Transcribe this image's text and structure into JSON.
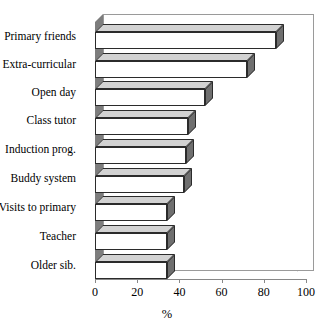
{
  "chart_data": {
    "type": "bar",
    "orientation": "horizontal",
    "title": "",
    "xlabel": "%",
    "ylabel": "",
    "xlim": [
      0,
      100
    ],
    "xticks": [
      0,
      20,
      40,
      60,
      80,
      100
    ],
    "grid": false,
    "style": "3d-horizontal-bar",
    "categories": [
      "Primary friends",
      "Extra-curricular",
      "Open day",
      "Class tutor",
      "Induction prog.",
      "Buddy system",
      "Visits to primary",
      "Teacher",
      "Older sib."
    ],
    "values": [
      86,
      72,
      52,
      44,
      43,
      42,
      34,
      34,
      34
    ],
    "series": [
      {
        "name": "%",
        "values": [
          86,
          72,
          52,
          44,
          43,
          42,
          34,
          34,
          34
        ]
      }
    ]
  },
  "axis": {
    "x_tick_labels": [
      "0",
      "20",
      "40",
      "60",
      "80",
      "100"
    ],
    "x_axis_title": "%"
  },
  "colors": {
    "bar_face": "#ffffff",
    "bar_top": "#d2d2d2",
    "bar_side": "#6f6f6f",
    "bar_outline": "#2b2b2b",
    "wall": "#7d7d7d",
    "axis": "#888888",
    "background": "#ffffff",
    "text": "#000000"
  }
}
